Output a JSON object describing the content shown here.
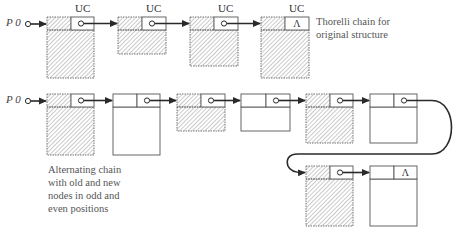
{
  "diagram": {
    "top_row": {
      "start_label": "P 0",
      "caption_lines": [
        "Thorelli chain for",
        "original structure"
      ],
      "nodes": [
        {
          "tag": "UC",
          "style": "old",
          "next": "pointer",
          "x": 47,
          "y": 17,
          "w": 47,
          "h": 61
        },
        {
          "tag": "UC",
          "style": "old",
          "next": "pointer",
          "x": 118,
          "y": 17,
          "w": 48,
          "h": 37
        },
        {
          "tag": "UC",
          "style": "old",
          "next": "pointer",
          "x": 190,
          "y": 17,
          "w": 48,
          "h": 49
        },
        {
          "tag": "UC",
          "style": "old",
          "next": "Λ",
          "x": 261,
          "y": 17,
          "w": 48,
          "h": 61
        }
      ]
    },
    "bottom_row": {
      "start_label": "P 0",
      "caption_lines": [
        "Alternating chain",
        "with old and new",
        "nodes in odd and",
        "even positions"
      ],
      "nodes": [
        {
          "style": "old",
          "next": "pointer",
          "x": 47,
          "y": 94,
          "w": 47,
          "h": 61
        },
        {
          "style": "new",
          "next": "pointer",
          "x": 113,
          "y": 94,
          "w": 47,
          "h": 61
        },
        {
          "style": "old",
          "next": "pointer",
          "x": 177,
          "y": 94,
          "w": 48,
          "h": 37
        },
        {
          "style": "new",
          "next": "pointer",
          "x": 241,
          "y": 94,
          "w": 49,
          "h": 37
        },
        {
          "style": "old",
          "next": "pointer",
          "x": 306,
          "y": 94,
          "w": 47,
          "h": 49
        },
        {
          "style": "new",
          "next": "pointer",
          "x": 370,
          "y": 94,
          "w": 47,
          "h": 49
        },
        {
          "style": "old",
          "next": "pointer",
          "x": 306,
          "y": 166,
          "w": 47,
          "h": 60
        },
        {
          "style": "new",
          "next": "Λ",
          "x": 370,
          "y": 166,
          "w": 47,
          "h": 60
        }
      ]
    },
    "null_symbol": "Λ",
    "colors": {
      "line": "#2a2a2a",
      "hatch": "#888888",
      "box_border": "#555555",
      "text": "#444444"
    }
  }
}
